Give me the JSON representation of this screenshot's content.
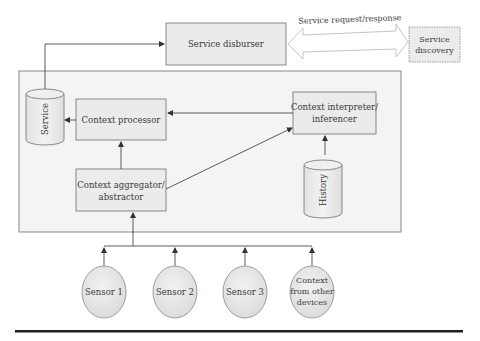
{
  "diagram": {
    "service_disburser": {
      "label": "Service disburser"
    },
    "service_discovery": {
      "label_line1": "Service",
      "label_line2": "discovery"
    },
    "double_arrow": {
      "label": "Service request/response"
    },
    "service_store": {
      "label": "Service"
    },
    "context_processor": {
      "label": "Context processor"
    },
    "context_interpreter": {
      "label_line1": "Context interpreter/",
      "label_line2": "inferencer"
    },
    "context_aggregator": {
      "label_line1": "Context aggregator/",
      "label_line2": "abstractor"
    },
    "history_store": {
      "label": "History"
    },
    "sources": [
      {
        "label_line1": "Sensor 1"
      },
      {
        "label_line1": "Sensor 2"
      },
      {
        "label_line1": "Sensor 3"
      },
      {
        "label_line1": "Context",
        "label_line2": "from other",
        "label_line3": "devices"
      }
    ],
    "colors": {
      "box_fill": "#ebebeb",
      "container_fill": "#f4f4f4",
      "stroke": "#6e6e6e",
      "text": "#3a3a3a",
      "rule": "#222222"
    }
  }
}
